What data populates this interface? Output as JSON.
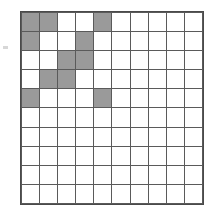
{
  "figure": {
    "type": "grid-shading-diagram",
    "rows": 10,
    "columns": 10,
    "total_cells": 100,
    "shaded_cell_count": 11,
    "unshaded_cell_count": 89,
    "colors": {
      "shaded_fill": "#9a9a9a",
      "unshaded_fill": "#ffffff",
      "gridline": "#5a5a5a",
      "outer_border": "#4a4a4a",
      "background": "#ffffff"
    },
    "shaded_cells_by_row": [
      [
        1,
        2,
        5
      ],
      [
        1,
        4
      ],
      [
        3,
        4
      ],
      [
        2,
        3
      ],
      [
        1,
        5
      ],
      [],
      [],
      [],
      [],
      []
    ],
    "grid_matrix": [
      [
        1,
        1,
        0,
        0,
        1,
        0,
        0,
        0,
        0,
        0
      ],
      [
        1,
        0,
        0,
        1,
        0,
        0,
        0,
        0,
        0,
        0
      ],
      [
        0,
        0,
        1,
        1,
        0,
        0,
        0,
        0,
        0,
        0
      ],
      [
        0,
        1,
        1,
        0,
        0,
        0,
        0,
        0,
        0,
        0
      ],
      [
        1,
        0,
        0,
        0,
        1,
        0,
        0,
        0,
        0,
        0
      ],
      [
        0,
        0,
        0,
        0,
        0,
        0,
        0,
        0,
        0,
        0
      ],
      [
        0,
        0,
        0,
        0,
        0,
        0,
        0,
        0,
        0,
        0
      ],
      [
        0,
        0,
        0,
        0,
        0,
        0,
        0,
        0,
        0,
        0
      ],
      [
        0,
        0,
        0,
        0,
        0,
        0,
        0,
        0,
        0,
        0
      ],
      [
        0,
        0,
        0,
        0,
        0,
        0,
        0,
        0,
        0,
        0
      ]
    ]
  }
}
